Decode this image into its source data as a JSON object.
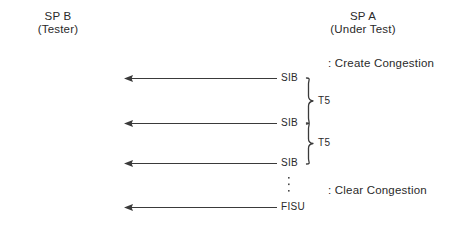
{
  "diagram": {
    "width": 453,
    "height": 227,
    "background": "#ffffff",
    "line_color": "#3a3a3a",
    "text_color": "#2a2a2a"
  },
  "actors": {
    "left": {
      "name": "SP B",
      "role": "(Tester)",
      "x": 58,
      "y": 12
    },
    "right": {
      "name": "SP A",
      "role": "(Under Test)",
      "x": 363,
      "y": 12
    }
  },
  "messages": [
    {
      "label": "SIB",
      "y": 78,
      "direction": "right-to-left"
    },
    {
      "label": "SIB",
      "y": 123,
      "direction": "right-to-left"
    },
    {
      "label": "SIB",
      "y": 163,
      "direction": "right-to-left"
    },
    {
      "label": "FISU",
      "y": 207,
      "direction": "right-to-left"
    }
  ],
  "timers": [
    {
      "label": "T5",
      "from_y": 78,
      "to_y": 123
    },
    {
      "label": "T5",
      "from_y": 123,
      "to_y": 163
    }
  ],
  "annotations": [
    {
      "text": ": Create Congestion",
      "x": 328,
      "y": 58
    },
    {
      "text": ": Clear Congestion",
      "x": 328,
      "y": 185
    }
  ],
  "continuation": {
    "symbol": "vertical-ellipsis",
    "x": 288,
    "y": 178,
    "dots": 3
  },
  "geometry": {
    "arrow_head_x": 124,
    "arrow_tail_x": 277,
    "message_label_x": 281,
    "brace_x": 306,
    "timer_label_x": 318
  }
}
